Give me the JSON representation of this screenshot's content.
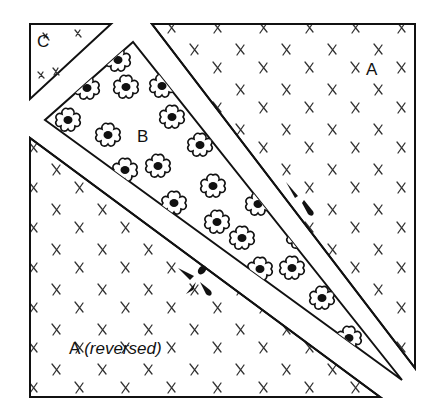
{
  "figure": {
    "pieces": [
      {
        "id": "C",
        "label": "C",
        "pattern": "crosses"
      },
      {
        "id": "A",
        "label": "A",
        "pattern": "crosses"
      },
      {
        "id": "B",
        "label": "B",
        "pattern": "flowers"
      },
      {
        "id": "A-reversed",
        "label": "A",
        "label_suffix": "(reversed)",
        "pattern": "crosses"
      }
    ],
    "colors": {
      "stroke": "#111111",
      "fill": "#ffffff",
      "pattern": "#333333"
    }
  }
}
